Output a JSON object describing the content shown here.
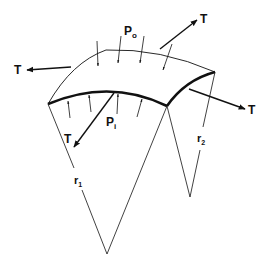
{
  "diagram": {
    "labels": {
      "outer_pressure": {
        "main": "P",
        "sub": "o"
      },
      "inner_pressure": {
        "main": "P",
        "sub": "i"
      },
      "tension_top_right": "T",
      "tension_left": "T",
      "tension_right": "T",
      "tension_bottom_left": "T",
      "radius_1": {
        "main": "r",
        "sub": "1"
      },
      "radius_2": {
        "main": "r",
        "sub": "2"
      }
    },
    "colors": {
      "line": "#111111",
      "background": "#ffffff"
    }
  }
}
